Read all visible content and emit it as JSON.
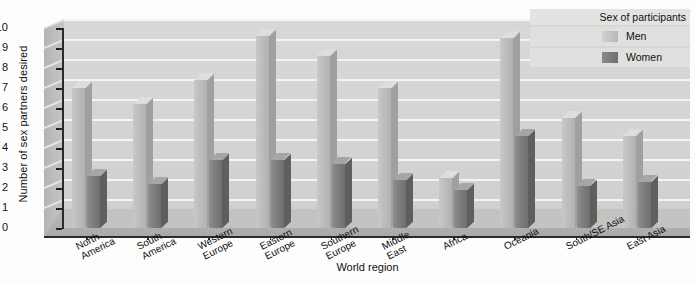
{
  "chart_data": {
    "type": "bar",
    "title": "",
    "xlabel": "World region",
    "ylabel": "Number of sex partners desired",
    "ylim": [
      0,
      10
    ],
    "ytick_step": 1,
    "grid": true,
    "legend_position": "top-right",
    "legend_title": "Sex of participants",
    "categories": [
      "North America",
      "South America",
      "Western Europe",
      "Eastern Europe",
      "Southern Europe",
      "Middle East",
      "Africa",
      "Oceania",
      "South/SE Asia",
      "East Asia"
    ],
    "category_lines": [
      [
        "North",
        "America"
      ],
      [
        "South",
        "America"
      ],
      [
        "Western",
        "Europe"
      ],
      [
        "Eastern",
        "Europe"
      ],
      [
        "Southern",
        "Europe"
      ],
      [
        "Middle",
        "East"
      ],
      [
        "Africa"
      ],
      [
        "Oceania"
      ],
      [
        "South/SE Asia"
      ],
      [
        "East Asia"
      ]
    ],
    "yticks": [
      "0",
      "1",
      "2",
      "3",
      "4",
      "5",
      "6",
      "7",
      "8",
      "9",
      "10"
    ],
    "series": [
      {
        "name": "Men",
        "color": "#bdbdbb",
        "values": [
          7.0,
          6.2,
          7.4,
          9.6,
          8.6,
          7.0,
          2.5,
          9.5,
          5.5,
          4.6
        ]
      },
      {
        "name": "Women",
        "color": "#7e7e7c",
        "values": [
          2.6,
          2.2,
          3.4,
          3.4,
          3.2,
          2.4,
          1.9,
          4.6,
          2.1,
          2.3
        ]
      }
    ]
  },
  "legend": {
    "title": "Sex of participants",
    "items": [
      {
        "label": "Men",
        "swatch": "men"
      },
      {
        "label": "Women",
        "swatch": "women"
      }
    ]
  },
  "axes": {
    "y_title": "Number of sex partners desired",
    "x_title": "World region"
  }
}
